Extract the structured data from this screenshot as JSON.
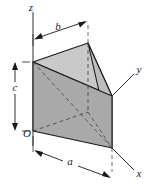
{
  "figure": {
    "type": "triangular-prism-3d-diagram",
    "background_color": "#ffffff",
    "line_color": "#1a1a1a",
    "axes": {
      "origin_label": "O",
      "z_label": "z",
      "y_label": "y",
      "x_label": "x"
    },
    "dimensions": [
      {
        "key": "b",
        "label": "b",
        "orientation": "horizontal-top",
        "description": "depth along y at top"
      },
      {
        "key": "c",
        "label": "c",
        "orientation": "vertical-left",
        "description": "height along z"
      },
      {
        "key": "a",
        "label": "a",
        "orientation": "diagonal-bottom",
        "description": "length along x at base"
      }
    ],
    "faces": {
      "front_face_color": "#a9a9a9",
      "top_face_color": "#c9c9c9",
      "right_face_color": "#bdbdbd",
      "bottom_face_color": "#9d9d9d"
    },
    "geometry": {
      "origin": [
        33,
        131
      ],
      "front_top_left": [
        33,
        62
      ],
      "apex_top": [
        88,
        43
      ],
      "right_mid": [
        112,
        96
      ],
      "right_bottom": [
        112,
        148
      ],
      "hidden_back_bottom": [
        88,
        112
      ]
    }
  }
}
